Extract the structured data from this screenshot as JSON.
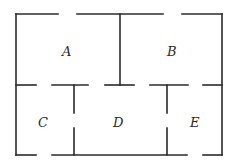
{
  "diagram": {
    "type": "floor-plan",
    "rooms": [
      {
        "id": "A",
        "label": "A",
        "x": 62,
        "y": 45
      },
      {
        "id": "B",
        "label": "B",
        "x": 168,
        "y": 45
      },
      {
        "id": "C",
        "label": "C",
        "x": 39,
        "y": 117
      },
      {
        "id": "D",
        "label": "D",
        "x": 114,
        "y": 117
      },
      {
        "id": "E",
        "label": "E",
        "x": 189,
        "y": 117
      }
    ],
    "wall_color": "#2a2a2a"
  }
}
